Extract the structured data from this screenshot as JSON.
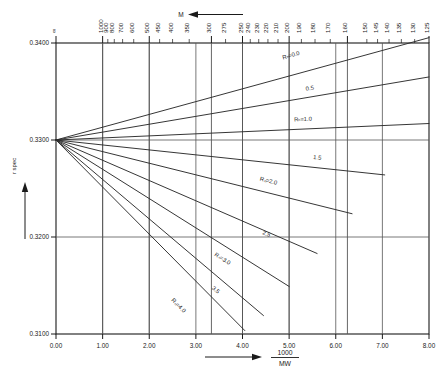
{
  "chart_data": {
    "type": "line",
    "title": "",
    "xlabel": "1000 / MW",
    "xlabel_num": "1000",
    "xlabel_den": "MW",
    "ylabel": "r spec",
    "xlim": [
      0.0,
      8.0
    ],
    "ylim": [
      0.31,
      0.34
    ],
    "grid": true,
    "legend_position": "inline-end-of-line",
    "x_ticks": [
      "0.00",
      "1.00",
      "2.00",
      "3.00",
      "4.00",
      "5.00",
      "6.00",
      "7.00",
      "8.00"
    ],
    "x_tick_values": [
      0,
      1,
      2,
      3,
      4,
      5,
      6,
      7,
      8
    ],
    "y_ticks": [
      "0.3400",
      "0.3300",
      "0.3200",
      "0.3100"
    ],
    "y_tick_values": [
      0.34,
      0.33,
      0.32,
      0.31
    ],
    "top_axis": {
      "label": "M",
      "arrow": "left",
      "infinity_symbol": "∞",
      "ticks": [
        {
          "label": "∞",
          "x": 0.0,
          "major": true
        },
        {
          "label": "1000",
          "x": 1.0,
          "major": true
        },
        {
          "label": "900",
          "x": 1.111,
          "major": false
        },
        {
          "label": "800",
          "x": 1.25,
          "major": false
        },
        {
          "label": "700",
          "x": 1.4286,
          "major": false
        },
        {
          "label": "600",
          "x": 1.6667,
          "major": false
        },
        {
          "label": "500",
          "x": 2.0,
          "major": true
        },
        {
          "label": "450",
          "x": 2.2222,
          "major": false
        },
        {
          "label": "400",
          "x": 2.5,
          "major": false
        },
        {
          "label": "350",
          "x": 2.8571,
          "major": false
        },
        {
          "label": "300",
          "x": 3.3333,
          "major": true
        },
        {
          "label": "275",
          "x": 3.6364,
          "major": false
        },
        {
          "label": "250",
          "x": 4.0,
          "major": true
        },
        {
          "label": "240",
          "x": 4.1667,
          "major": false
        },
        {
          "label": "230",
          "x": 4.3478,
          "major": false
        },
        {
          "label": "220",
          "x": 4.5455,
          "major": false
        },
        {
          "label": "210",
          "x": 4.7619,
          "major": false
        },
        {
          "label": "200",
          "x": 5.0,
          "major": true
        },
        {
          "label": "190",
          "x": 5.2632,
          "major": false
        },
        {
          "label": "180",
          "x": 5.5556,
          "major": false
        },
        {
          "label": "170",
          "x": 5.8824,
          "major": false
        },
        {
          "label": "160",
          "x": 6.25,
          "major": true
        },
        {
          "label": "150",
          "x": 6.6667,
          "major": false
        },
        {
          "label": "145",
          "x": 6.8966,
          "major": false
        },
        {
          "label": "140",
          "x": 7.1429,
          "major": false
        },
        {
          "label": "135",
          "x": 7.4074,
          "major": false
        },
        {
          "label": "130",
          "x": 7.6923,
          "major": false
        },
        {
          "label": "125",
          "x": 8.0,
          "major": true
        }
      ]
    },
    "origin": {
      "x": 0.0,
      "y": 0.33
    },
    "series": [
      {
        "name": "R_N=0.0",
        "label": "Rₙ=0.0",
        "x_end": 8.0,
        "y_end": 0.34055,
        "label_x": 5.05,
        "label_y": 0.33855
      },
      {
        "name": "0.5",
        "label": "0.5",
        "x_end": 8.0,
        "y_end": 0.3365,
        "label_x": 5.45,
        "label_y": 0.33515
      },
      {
        "name": "R_N=1.0",
        "label": "Rₙ=1.0",
        "x_end": 8.0,
        "y_end": 0.3317,
        "label_x": 5.3,
        "label_y": 0.33195
      },
      {
        "name": "1.5",
        "label": "1.5",
        "x_end": 7.05,
        "y_end": 0.3264,
        "label_x": 5.6,
        "label_y": 0.328
      },
      {
        "name": "R_N=2.0",
        "label": "Rₙ=2.0",
        "x_end": 6.35,
        "y_end": 0.3224,
        "label_x": 4.55,
        "label_y": 0.3256
      },
      {
        "name": "2.5",
        "label": "2.5",
        "x_end": 5.6,
        "y_end": 0.3183,
        "label_x": 4.5,
        "label_y": 0.32015
      },
      {
        "name": "R_N=3.0",
        "label": "Rₙ=3.0",
        "x_end": 5.0,
        "y_end": 0.3149,
        "label_x": 3.55,
        "label_y": 0.3176
      },
      {
        "name": "3.5",
        "label": "3.5",
        "x_end": 4.45,
        "y_end": 0.3119,
        "label_x": 3.4,
        "label_y": 0.3144
      },
      {
        "name": "R_N=4.0",
        "label": "Rₙ=4.0",
        "x_end": 4.05,
        "y_end": 0.31035,
        "label_x": 2.6,
        "label_y": 0.3128
      }
    ]
  },
  "style": {
    "line_color": "#2b2b2b",
    "axis_color": "#1a1a1a",
    "grid_color": "#555555",
    "background": "#ffffff"
  }
}
